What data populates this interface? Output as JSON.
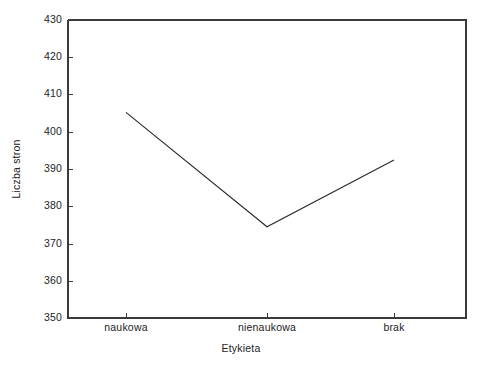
{
  "chart_data": {
    "type": "line",
    "title": "",
    "xlabel": "Etykieta",
    "ylabel": "Liczba stron",
    "categories": [
      "naukowa",
      "nienaukowa",
      "brak"
    ],
    "values": [
      405.2,
      374.5,
      392.4
    ],
    "series": [
      {
        "name": "Liczba stron",
        "values": [
          405.2,
          374.5,
          392.4
        ]
      }
    ],
    "ylim": [
      350,
      430
    ],
    "yticks": [
      350,
      360,
      370,
      380,
      390,
      400,
      410,
      420,
      430
    ],
    "ytick_labels": [
      "350",
      "360",
      "370",
      "380",
      "390",
      "400",
      "410",
      "420",
      "430"
    ],
    "xtick_labels": [
      "naukowa",
      "nienaukowa",
      "brak"
    ],
    "grid": false,
    "legend": false,
    "legend_position": "none",
    "line_color": "#2b2b2b",
    "axis_color": "#3b3b3b",
    "background_color": "#ffffff",
    "markers": false,
    "annotations": []
  },
  "axes": {
    "y_title": "Liczba stron",
    "x_title": "Etykieta"
  }
}
